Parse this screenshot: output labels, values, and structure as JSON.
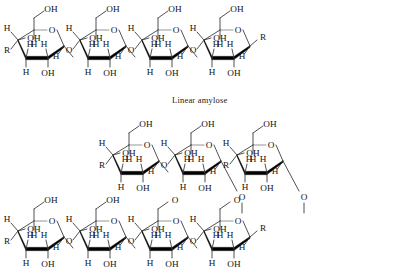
{
  "figure": {
    "background_color": "#ffffff",
    "ink_color": "#141414",
    "bold_bond_color": "#000000",
    "thin_bond_color": "#3d3d3d",
    "pale_bond_color": "#8a8a8a"
  },
  "caption": {
    "linear_amylose": "Linear amylose"
  },
  "labels": {
    "hydroxyl": "OH",
    "hydrogen": "H",
    "oxygen": "O",
    "residue": "R"
  },
  "chemistry": {
    "ring_type": "Haworth pyranose",
    "monomer": "alpha-D-glucopyranose",
    "chain_linkage": "alpha-1,4-glycosidic",
    "branch_linkage": "alpha-1,6-glycosidic"
  },
  "rows": [
    {
      "name": "top-row-linear-amylose",
      "y": 22,
      "x_start": 8,
      "units": [
        {
          "name": "glucose-1",
          "left_group": "R",
          "c6_label": "OH",
          "right_group": "link"
        },
        {
          "name": "glucose-2",
          "left_group": "link",
          "c6_label": "OH",
          "right_group": "link"
        },
        {
          "name": "glucose-3",
          "left_group": "link",
          "c6_label": "OH",
          "right_group": "link"
        },
        {
          "name": "glucose-4",
          "left_group": "link",
          "c6_label": "OH",
          "right_group": "R"
        }
      ]
    },
    {
      "name": "middle-row-branch-chains",
      "y": 137,
      "x_start": 103,
      "units": [
        {
          "name": "glucose-5",
          "left_group": "R",
          "c6_label": "OH",
          "right_group": "link"
        },
        {
          "name": "glucose-6",
          "left_group": "link",
          "c6_label": "OH",
          "right_group": "branch-down"
        },
        {
          "name": "glucose-7",
          "left_group": "R",
          "c6_label": "OH",
          "right_group": "branch-down"
        }
      ]
    },
    {
      "name": "bottom-row-main-chain",
      "y": 213,
      "x_start": 8,
      "units": [
        {
          "name": "glucose-8",
          "left_group": "R",
          "c6_label": "OH",
          "right_group": "link"
        },
        {
          "name": "glucose-9",
          "left_group": "link",
          "c6_label": "OH",
          "right_group": "link"
        },
        {
          "name": "glucose-10",
          "left_group": "link",
          "c6_label": "O",
          "right_group": "link"
        },
        {
          "name": "glucose-11",
          "left_group": "link",
          "c6_label": "O",
          "right_group": "R"
        }
      ]
    }
  ]
}
